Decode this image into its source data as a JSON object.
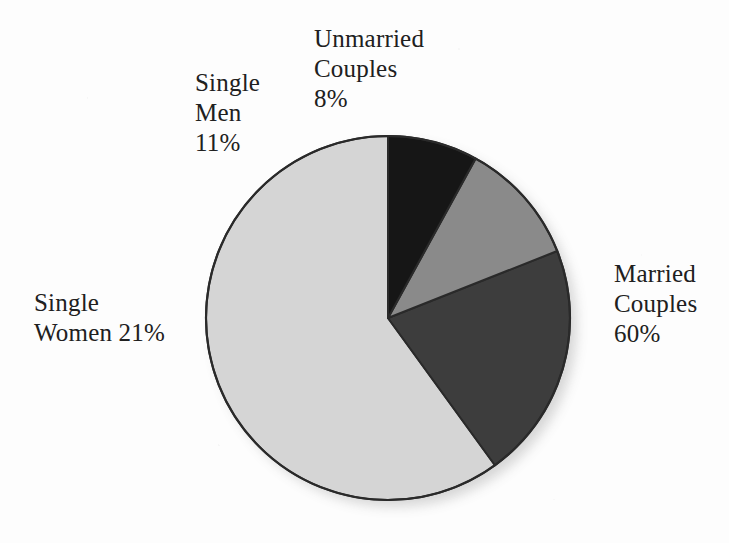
{
  "figure": {
    "background_color": "#fdfdfd",
    "text_color": "#202020"
  },
  "chart_data": {
    "type": "pie",
    "title": "",
    "subtitle": "",
    "xlabel": "",
    "ylabel": "",
    "legend_position": "none",
    "grid": false,
    "units": "percent",
    "total": 100,
    "start_angle_deg": 0,
    "direction": "counterclockwise",
    "center": {
      "x": 388,
      "y": 318
    },
    "radius": 182,
    "categories": [
      "Married Couples",
      "Single Women",
      "Single Men",
      "Unmarried Couples"
    ],
    "values": [
      60,
      21,
      11,
      8
    ],
    "labels": [
      "60%",
      "21%",
      "11%",
      "8%"
    ],
    "colors": [
      "#d5d5d5",
      "#3d3d3d",
      "#8a8a8a",
      "#161616"
    ],
    "slices": [
      {
        "name": "married-couples",
        "category": "Married Couples",
        "value": 60,
        "value_label": "60%",
        "color": "#d5d5d5",
        "start_angle_deg": 0,
        "end_angle_deg": -216
      },
      {
        "name": "single-women",
        "category": "Single Women",
        "value": 21,
        "value_label": "21%",
        "color": "#3d3d3d",
        "start_angle_deg": -216,
        "end_angle_deg": -291.6
      },
      {
        "name": "single-men",
        "category": "Single Men",
        "value": 11,
        "value_label": "11%",
        "color": "#8a8a8a",
        "start_angle_deg": -291.6,
        "end_angle_deg": -331.2
      },
      {
        "name": "unmarried-couples",
        "category": "Unmarried Couples",
        "value": 8,
        "value_label": "8%",
        "color": "#161616",
        "start_angle_deg": -331.2,
        "end_angle_deg": -360
      }
    ],
    "outline_color": "#2a2a2a",
    "outline_width": 2
  },
  "labels": {
    "unmarried_couples": "Unmarried\nCouples\n8%",
    "single_men": "Single\nMen\n11%",
    "single_women": "Single\nWomen 21%",
    "married_couples": "Married\nCouples\n60%"
  }
}
